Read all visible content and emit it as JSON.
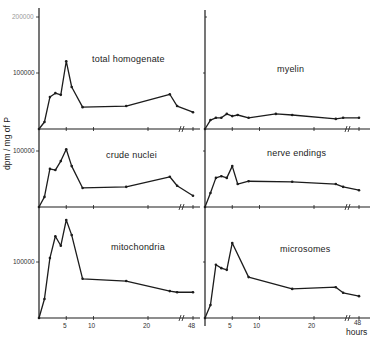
{
  "chart_data": {
    "type": "line",
    "layout": "3x2 small multiples, shared x and y scales",
    "ylabel": "dpm / mg of P",
    "xlabel": "hours",
    "x_ticks": [
      "5",
      "10",
      "20",
      "48"
    ],
    "x_axis_break": "between 24 and 48 hours",
    "y_ticks_left": [
      "200000",
      "100000"
    ],
    "ylim": [
      0,
      200000
    ],
    "grid": false,
    "legend": "none (panel titles inside each plot)",
    "panels": [
      {
        "title": "total homogenate",
        "position": "top-left",
        "x": [
          0,
          1,
          2,
          3,
          4,
          5,
          6,
          8,
          16,
          24,
          36,
          48
        ],
        "values": [
          0,
          12500,
          57000,
          64000,
          61000,
          121000,
          75000,
          39000,
          41000,
          62000,
          41000,
          30000
        ]
      },
      {
        "title": "myelin",
        "position": "top-right",
        "x": [
          0,
          1,
          2,
          3,
          4,
          5,
          6,
          8,
          13,
          16,
          24,
          36,
          48
        ],
        "values": [
          0,
          16000,
          20000,
          20000,
          27000,
          23000,
          25000,
          20000,
          27000,
          25000,
          18000,
          20000,
          20000
        ]
      },
      {
        "title": "crude nuclei",
        "position": "middle-left",
        "x": [
          0,
          1,
          2,
          3,
          4,
          5,
          6,
          8,
          16,
          24,
          36,
          48
        ],
        "values": [
          0,
          18000,
          68000,
          66000,
          82000,
          103000,
          73000,
          34000,
          36000,
          54000,
          38000,
          20000
        ]
      },
      {
        "title": "nerve endings",
        "position": "middle-right",
        "x": [
          0,
          1,
          2,
          3,
          4,
          5,
          6,
          8,
          16,
          24,
          36,
          48
        ],
        "values": [
          0,
          25000,
          52000,
          55000,
          52000,
          73000,
          41000,
          46000,
          45000,
          41000,
          36000,
          30000
        ]
      },
      {
        "title": "mitochondria",
        "position": "bottom-left",
        "x": [
          0,
          1,
          2,
          3,
          4,
          5,
          6,
          8,
          16,
          24,
          36,
          48
        ],
        "values": [
          0,
          34000,
          107000,
          146000,
          129000,
          175000,
          148000,
          70000,
          66000,
          48000,
          46000,
          46000
        ]
      },
      {
        "title": "microsomes",
        "position": "bottom-right",
        "x": [
          0,
          1,
          2,
          3,
          4,
          5,
          8,
          16,
          24,
          36,
          48
        ],
        "values": [
          0,
          23000,
          95000,
          89000,
          86000,
          134000,
          73000,
          52000,
          55000,
          45000,
          39000
        ]
      }
    ]
  },
  "labels": {
    "ylabel": "dpm / mg of P",
    "xunit": "hours",
    "tick_200000": "200000",
    "tick_100000": "100000",
    "x5": "5",
    "x10": "10",
    "x20": "20",
    "x48": "48"
  }
}
